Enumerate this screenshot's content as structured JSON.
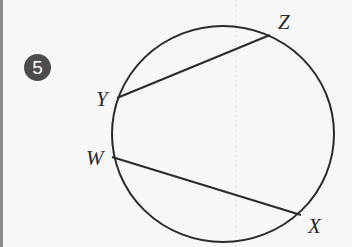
{
  "problem": {
    "number": "5"
  },
  "diagram": {
    "type": "circle-with-two-chords",
    "points": [
      {
        "label": "Z",
        "x": 270,
        "y": 35
      },
      {
        "label": "Y",
        "x": 117,
        "y": 98
      },
      {
        "label": "W",
        "x": 112,
        "y": 157
      },
      {
        "label": "X",
        "x": 301,
        "y": 215
      }
    ],
    "chords": [
      {
        "from": "Y",
        "to": "Z"
      },
      {
        "from": "W",
        "to": "X"
      }
    ],
    "circle": {
      "cx": 223,
      "cy": 134,
      "rx": 111,
      "ry": 108
    },
    "stroke_color": "#2a2a2a"
  },
  "labels": {
    "Z": "Z",
    "Y": "Y",
    "W": "W",
    "X": "X"
  }
}
